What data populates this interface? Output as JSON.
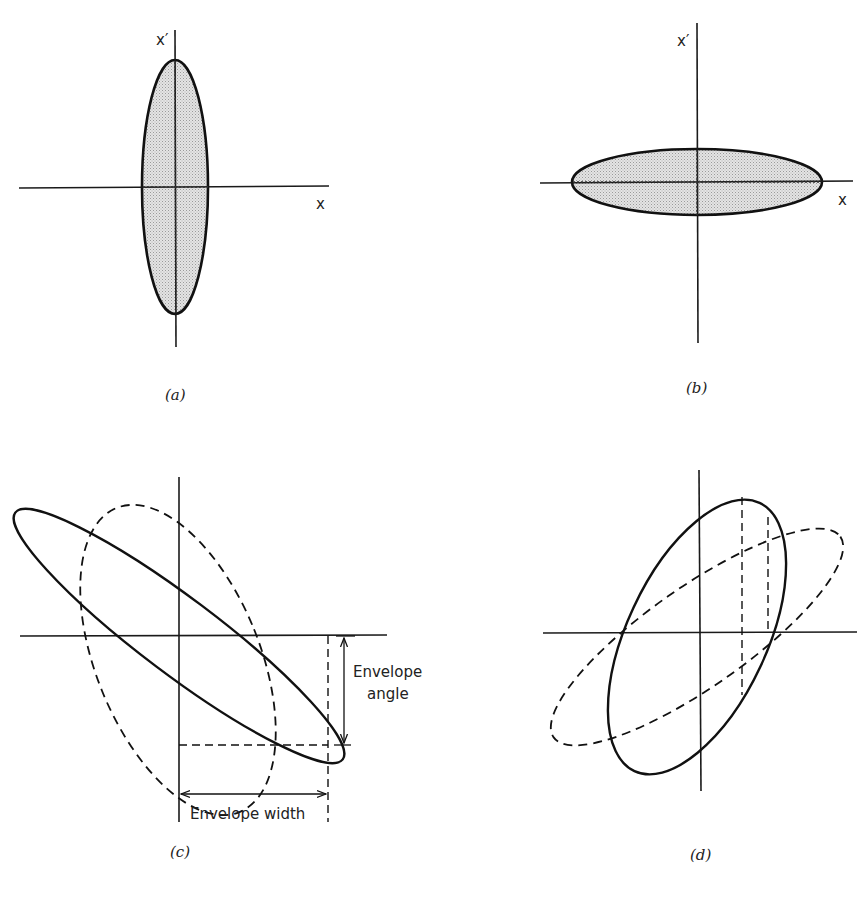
{
  "figure": {
    "panels": [
      {
        "id": "a",
        "caption": "(a)",
        "axis_label_vertical": "x′",
        "axis_label_horizontal": "x",
        "description": "Upright ellipse (shaded), tall and narrow, centered at origin"
      },
      {
        "id": "b",
        "caption": "(b)",
        "axis_label_vertical": "x′",
        "axis_label_horizontal": "x",
        "description": "Horizontal ellipse (shaded), wide and flat, centered at origin"
      },
      {
        "id": "c",
        "caption": "(c)",
        "annotations": {
          "envelope_angle_line1": "Envelope",
          "envelope_angle_line2": "angle",
          "envelope_width": "Envelope width"
        },
        "description": "Solid ellipse tilted down-right, dashed ellipse less tilted; dimension arrows for envelope angle and width"
      },
      {
        "id": "d",
        "caption": "(d)",
        "description": "Solid ellipse tilted up-right, dashed ellipse more tilted; vertical dashed guide lines"
      }
    ]
  }
}
